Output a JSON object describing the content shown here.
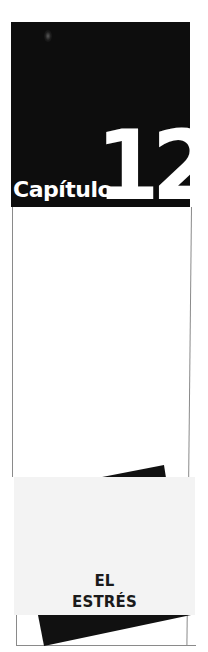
{
  "chapter": {
    "label": "Capítulo",
    "number": "12"
  },
  "title": {
    "line1": "EL",
    "line2": "ESTRÉS"
  },
  "colors": {
    "black_box": "#0d0d0d",
    "panel": "#f3f3f3",
    "text_on_dark": "#ffffff",
    "title_text": "#1a1a1a",
    "frame_line": "#8a8a8a"
  }
}
